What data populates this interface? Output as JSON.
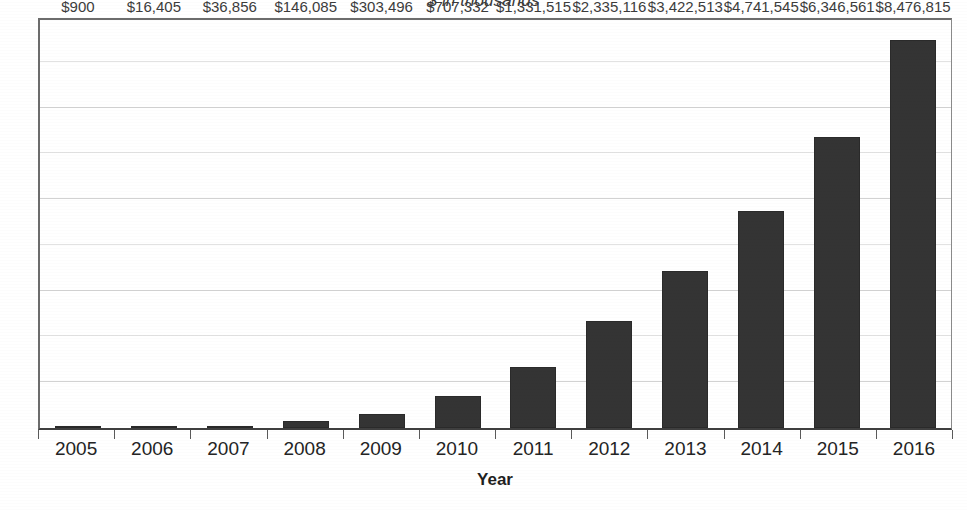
{
  "chart_data": {
    "type": "bar",
    "title": "$ in thousands",
    "xlabel": "Year",
    "ylabel": "Annual sales",
    "categories": [
      "2005",
      "2006",
      "2007",
      "2008",
      "2009",
      "2010",
      "2011",
      "2012",
      "2013",
      "2014",
      "2015",
      "2016"
    ],
    "values": [
      900,
      16405,
      36856,
      146085,
      303496,
      707332,
      1331515,
      2335116,
      3422513,
      4741545,
      6346561,
      8476815
    ],
    "value_labels": [
      "$900",
      "$16,405",
      "$36,856",
      "$146,085",
      "$303,496",
      "$707,332",
      "$1,331,515",
      "$2,335,116",
      "$3,422,513",
      "$4,741,545",
      "$6,346,561",
      "$8,476,815"
    ],
    "ylim": [
      0,
      9000000
    ],
    "y_tick_labels_shown": false,
    "gridlines": {
      "visible": true,
      "orientation": "horizontal",
      "count": 8,
      "values": [
        1000000,
        2000000,
        3000000,
        4000000,
        5000000,
        6000000,
        7000000,
        8000000
      ]
    },
    "legend": {
      "visible": false
    },
    "series_name": "Annual sales",
    "colors": {
      "bar_fill": "#343434",
      "bar_border": "#2a2a2a",
      "gridline": "#d2d2d2",
      "axis": "#3f3f3f",
      "text": "#242424",
      "background": "#ffffff"
    }
  },
  "axes": {
    "x_tick_labels": [
      "2005",
      "2006",
      "2007",
      "2008",
      "2009",
      "2010",
      "2011",
      "2012",
      "2013",
      "2014",
      "2015",
      "2016"
    ],
    "x_title": "Year",
    "y_title": "Annual sales"
  },
  "title": {
    "text": "$ in thousands"
  }
}
